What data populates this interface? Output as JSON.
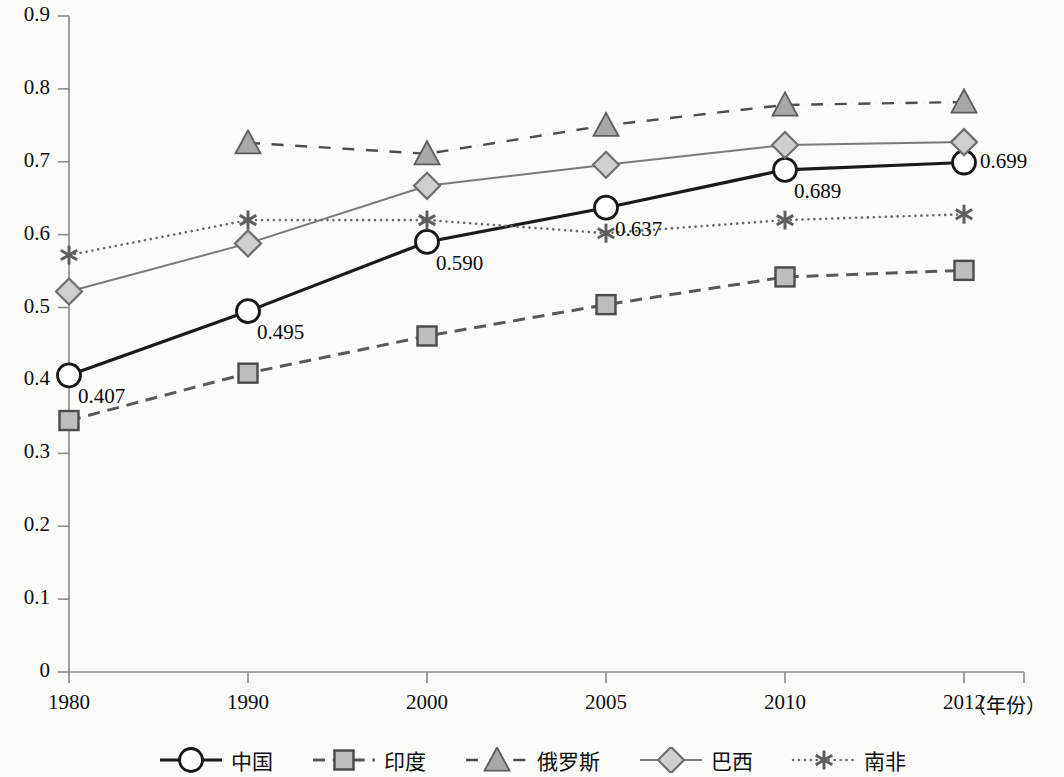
{
  "chart_data": {
    "type": "line",
    "title": "",
    "xlabel": "（年份）",
    "ylabel": "",
    "categories": [
      "1980",
      "1990",
      "2000",
      "2005",
      "2010",
      "2012"
    ],
    "ylim": [
      0,
      0.9
    ],
    "ytick_labels": [
      "0",
      "0.1",
      "0.2",
      "0.3",
      "0.4",
      "0.5",
      "0.6",
      "0.7",
      "0.8",
      "0.9"
    ],
    "ytick_values": [
      0,
      0.1,
      0.2,
      0.3,
      0.4,
      0.5,
      0.6,
      0.7,
      0.8,
      0.9
    ],
    "grid": false,
    "legend_position": "bottom",
    "series": [
      {
        "name": "中国",
        "marker": "circle",
        "line_style": "solid",
        "color": "#1a1a1a",
        "line_width": 3.2,
        "values": [
          0.407,
          0.495,
          0.59,
          0.637,
          0.689,
          0.699
        ],
        "data_labels": [
          "0.407",
          "0.495",
          "0.590",
          "0.637",
          "0.689",
          "0.699"
        ]
      },
      {
        "name": "印度",
        "marker": "square",
        "line_style": "dashed",
        "color": "#595959",
        "line_width": 3.0,
        "values": [
          0.345,
          0.41,
          0.461,
          0.504,
          0.542,
          0.551
        ],
        "data_labels": []
      },
      {
        "name": "俄罗斯",
        "marker": "triangle",
        "line_style": "dashdot",
        "color": "#4d4d4d",
        "line_width": 2.4,
        "values": [
          null,
          0.726,
          0.711,
          0.75,
          0.778,
          0.782
        ],
        "data_labels": []
      },
      {
        "name": "巴西",
        "marker": "diamond",
        "line_style": "solid",
        "color": "#7a7a7a",
        "line_width": 2.0,
        "values": [
          0.522,
          0.588,
          0.667,
          0.696,
          0.723,
          0.727
        ],
        "data_labels": []
      },
      {
        "name": "南非",
        "marker": "asterisk",
        "line_style": "dotted",
        "color": "#6b6b6b",
        "line_width": 2.6,
        "values": [
          0.572,
          0.62,
          0.62,
          0.602,
          0.62,
          0.628
        ],
        "data_labels": []
      }
    ]
  },
  "axes": {
    "x_axis_label_unit": "（年份）"
  }
}
